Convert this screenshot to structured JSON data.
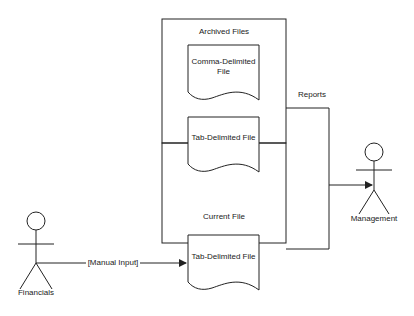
{
  "diagram": {
    "containers": {
      "archived": {
        "title": "Archived Files"
      },
      "current": {
        "title": "Current File"
      }
    },
    "documents": [
      {
        "label_line1": "Comma-Delimited",
        "label_line2": "File"
      },
      {
        "label": "Tab-Delimited File"
      },
      {
        "label": "Tab-Delimited File"
      }
    ],
    "actors": {
      "financials": {
        "label": "Financials"
      },
      "management": {
        "label": "Management"
      }
    },
    "edges": {
      "manual_input": {
        "label": "[Manual Input]"
      },
      "reports": {
        "label": "Reports"
      }
    },
    "colors": {
      "stroke": "#222222",
      "background": "#ffffff"
    }
  }
}
